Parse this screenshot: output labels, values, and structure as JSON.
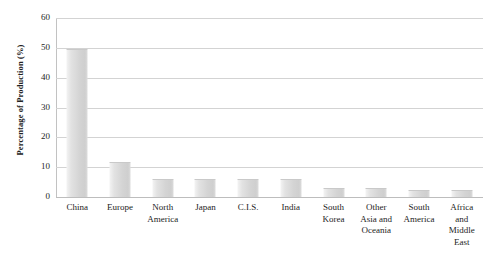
{
  "chart_data": {
    "type": "bar",
    "title": "",
    "xlabel": "",
    "ylabel": "Percentage of Production (%)",
    "ylim": [
      0,
      60
    ],
    "ytick_labels": [
      "60",
      "50",
      "40",
      "30",
      "20",
      "10",
      "0"
    ],
    "ytick_values": [
      60,
      50,
      40,
      30,
      20,
      10,
      0
    ],
    "grid": true,
    "legend": "none",
    "categories": [
      "China",
      "Europe",
      "North America",
      "Japan",
      "C.I.S.",
      "India",
      "South Korea",
      "Other Asia and Oceania",
      "South America",
      "Africa and Middle East"
    ],
    "category_label_lines": [
      [
        "China"
      ],
      [
        "Europe"
      ],
      [
        "North",
        "America"
      ],
      [
        "Japan"
      ],
      [
        "C.I.S."
      ],
      [
        "India"
      ],
      [
        "South",
        "Korea"
      ],
      [
        "Other",
        "Asia and",
        "Oceania"
      ],
      [
        "South",
        "America"
      ],
      [
        "Africa",
        "and",
        "Middle",
        "East"
      ]
    ],
    "values": [
      49.5,
      11.8,
      6.0,
      6.0,
      6.0,
      6.0,
      3.0,
      3.0,
      2.2,
      2.2
    ],
    "bar_color": "#d7d7d7",
    "gridline_color": "#d3d3d3",
    "axis_color": "#c2c2c2",
    "background_color": "#ffffff"
  }
}
